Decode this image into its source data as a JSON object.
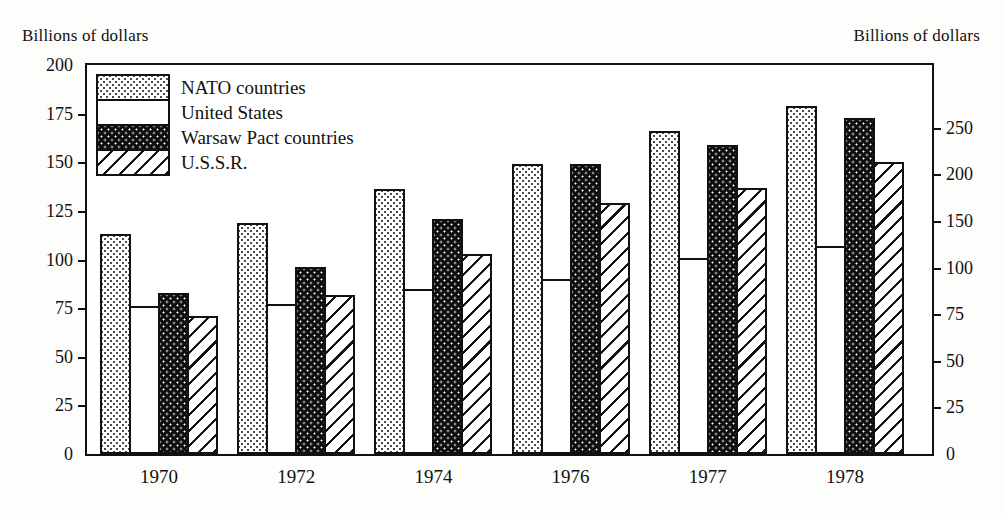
{
  "axis": {
    "left_caption": "Billions of dollars",
    "right_caption": "Billions of dollars",
    "left_ticks": [
      "200",
      "175",
      "150",
      "125",
      "100",
      "75",
      "50",
      "25",
      "0"
    ],
    "right_ticks": [
      "250",
      "200",
      "150",
      "100",
      "75",
      "50",
      "25",
      "0"
    ]
  },
  "legend": {
    "items": [
      {
        "label": "NATO countries",
        "pattern": "dotted-light"
      },
      {
        "label": "United States",
        "pattern": "blank-white"
      },
      {
        "label": "Warsaw Pact countries",
        "pattern": "dotted-black"
      },
      {
        "label": "U.S.S.R.",
        "pattern": "diagonal-hatch"
      }
    ]
  },
  "chart_data": {
    "type": "bar",
    "title": "",
    "xlabel": "",
    "ylabel": "Billions of dollars",
    "ylim": [
      0,
      200
    ],
    "ylim_right": [
      0,
      275
    ],
    "grid": false,
    "legend_position": "top-left-inside",
    "categories": [
      "1970",
      "1972",
      "1974",
      "1976",
      "1977",
      "1978"
    ],
    "series": [
      {
        "name": "NATO countries",
        "values": [
          113,
          119,
          136,
          149,
          166,
          179
        ]
      },
      {
        "name": "United States",
        "values": [
          76,
          77,
          85,
          90,
          101,
          107
        ]
      },
      {
        "name": "Warsaw Pact countries",
        "values": [
          83,
          96,
          121,
          149,
          159,
          173
        ]
      },
      {
        "name": "U.S.S.R.",
        "values": [
          71,
          82,
          103,
          129,
          137,
          150
        ]
      }
    ],
    "right_axis_ticks": [
      0,
      25,
      50,
      75,
      100,
      150,
      200,
      250
    ],
    "left_axis_ticks": [
      0,
      25,
      50,
      75,
      100,
      125,
      150,
      175,
      200
    ]
  },
  "colors": {
    "ink": "#111111",
    "paper": "#fdfdfb",
    "plot_background": "#ffffff"
  }
}
